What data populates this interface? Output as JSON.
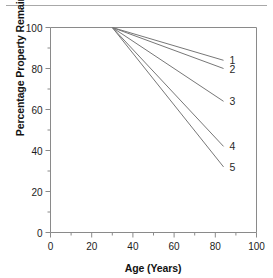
{
  "figure": {
    "top_rule": "horizontal-rule",
    "background_color": "#ffffff",
    "line_color": "#777777",
    "axis_color": "#8a8a8a",
    "text_color": "#1a1a1a"
  },
  "chart_data": {
    "type": "line",
    "title": "",
    "xlabel": "Age (Years)",
    "ylabel": "Percentage Property Remaining (Average)",
    "xlim": [
      0,
      100
    ],
    "ylim": [
      0,
      100
    ],
    "xticks": [
      0,
      20,
      40,
      60,
      80,
      100
    ],
    "xticklabels": [
      "0",
      "20",
      "40",
      "60",
      "80",
      "100"
    ],
    "xminorticks": [
      10,
      30,
      50,
      70,
      90
    ],
    "yticks": [
      0,
      20,
      40,
      60,
      80,
      100
    ],
    "yticklabels": [
      "0",
      "20",
      "40",
      "60",
      "80",
      "100"
    ],
    "yminorticks": [
      10,
      30,
      50,
      70,
      90
    ],
    "grid": false,
    "legend": "inline-end-labels",
    "x": [
      30,
      84
    ],
    "series": [
      {
        "name": "1",
        "label": "1",
        "values": [
          100,
          84
        ]
      },
      {
        "name": "2",
        "label": "2",
        "values": [
          100,
          80
        ]
      },
      {
        "name": "3",
        "label": "3",
        "values": [
          100,
          64
        ]
      },
      {
        "name": "4",
        "label": "4",
        "values": [
          100,
          42
        ]
      },
      {
        "name": "5",
        "label": "5",
        "values": [
          100,
          32
        ]
      }
    ]
  }
}
